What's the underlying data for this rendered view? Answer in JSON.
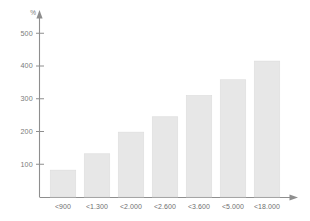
{
  "chart_data": {
    "type": "bar",
    "title": "",
    "subtitle": "",
    "xlabel": "",
    "ylabel": "%",
    "categories": [
      "<900",
      "<1.300",
      "<2.000",
      "<2.600",
      "<3.600",
      "<5.000",
      "<18.000"
    ],
    "values": [
      82,
      132,
      198,
      245,
      310,
      358,
      415
    ],
    "ylim": [
      0,
      540
    ],
    "yticks": [
      100,
      200,
      300,
      400,
      500
    ],
    "ytick_labels": [
      "100",
      "200",
      "300",
      "400",
      "500"
    ],
    "grid": false,
    "legend": null,
    "legend_position": "none",
    "annotations": [],
    "colors": {
      "bar_fill": "#e7e7e7",
      "bar_stroke": "#dcdcdc",
      "axis": "#8e8e8e",
      "tick_text": "#7a7a7a",
      "category_text": "#6f6f6f",
      "background": "#ffffff"
    }
  }
}
